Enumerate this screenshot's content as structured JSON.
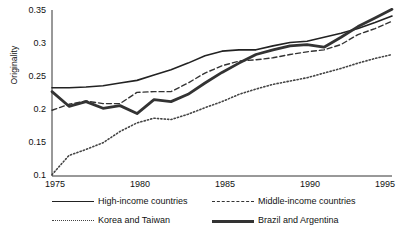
{
  "chart_data": {
    "type": "line",
    "title": "",
    "xlabel": "",
    "ylabel": "Originality",
    "xlim": [
      1975,
      1995
    ],
    "ylim": [
      0.1,
      0.35
    ],
    "grid": false,
    "legend_position": "bottom",
    "xticks": [
      "1975",
      "1980",
      "1985",
      "1990",
      "1995"
    ],
    "xtick_values": [
      1975,
      1980,
      1985,
      1990,
      1995
    ],
    "yticks": [
      "0.1",
      "0.15",
      "0.2",
      "0.25",
      "0.3",
      "0.35"
    ],
    "ytick_values": [
      0.1,
      0.15,
      0.2,
      0.25,
      0.3,
      0.35
    ],
    "x": [
      1975,
      1976,
      1977,
      1978,
      1979,
      1980,
      1981,
      1982,
      1983,
      1984,
      1985,
      1986,
      1987,
      1988,
      1989,
      1990,
      1991,
      1992,
      1993,
      1994,
      1995
    ],
    "series": [
      {
        "name": "High-income countries",
        "style": "solid-thin",
        "color": "#222222",
        "values": [
          0.233,
          0.233,
          0.234,
          0.236,
          0.24,
          0.244,
          0.252,
          0.26,
          0.27,
          0.281,
          0.288,
          0.29,
          0.29,
          0.296,
          0.301,
          0.303,
          0.309,
          0.315,
          0.322,
          0.331,
          0.341
        ]
      },
      {
        "name": "Middle-income countries",
        "style": "dashed",
        "color": "#333333",
        "values": [
          0.199,
          0.208,
          0.213,
          0.209,
          0.209,
          0.226,
          0.227,
          0.227,
          0.24,
          0.255,
          0.266,
          0.273,
          0.275,
          0.278,
          0.283,
          0.287,
          0.29,
          0.298,
          0.313,
          0.322,
          0.333
        ]
      },
      {
        "name": "Korea and Taiwan",
        "style": "dotted",
        "color": "#444444",
        "values": [
          0.102,
          0.131,
          0.14,
          0.15,
          0.167,
          0.18,
          0.187,
          0.185,
          0.193,
          0.203,
          0.212,
          0.223,
          0.231,
          0.238,
          0.243,
          0.248,
          0.255,
          0.262,
          0.27,
          0.277,
          0.283
        ]
      },
      {
        "name": "Brazil and Argentina",
        "style": "solid-thick",
        "color": "#333333",
        "values": [
          0.227,
          0.205,
          0.212,
          0.202,
          0.206,
          0.194,
          0.215,
          0.212,
          0.223,
          0.24,
          0.256,
          0.27,
          0.283,
          0.29,
          0.296,
          0.298,
          0.294,
          0.309,
          0.325,
          0.338,
          0.351
        ]
      }
    ]
  }
}
